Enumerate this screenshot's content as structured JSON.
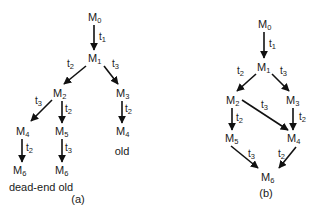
{
  "diagram_a": {
    "caption": "(a)",
    "nodes": [
      {
        "id": "a0",
        "base": "M",
        "sub": "0",
        "x": 93,
        "y": 20
      },
      {
        "id": "a1",
        "base": "M",
        "sub": "1",
        "x": 94,
        "y": 61
      },
      {
        "id": "a2",
        "base": "M",
        "sub": "2",
        "x": 59,
        "y": 96
      },
      {
        "id": "a3",
        "base": "M",
        "sub": "3",
        "x": 122,
        "y": 96
      },
      {
        "id": "a4",
        "base": "M",
        "sub": "4",
        "x": 22,
        "y": 134
      },
      {
        "id": "a5",
        "base": "M",
        "sub": "5",
        "x": 61,
        "y": 134
      },
      {
        "id": "a6",
        "base": "M",
        "sub": "4",
        "x": 122,
        "y": 134
      },
      {
        "id": "a7",
        "base": "M",
        "sub": "6",
        "x": 19,
        "y": 173
      },
      {
        "id": "a8",
        "base": "M",
        "sub": "6",
        "x": 61,
        "y": 173
      }
    ],
    "edges": [
      {
        "from": "a0",
        "to": "a1",
        "label": "t",
        "label_sub": "1"
      },
      {
        "from": "a1",
        "to": "a2",
        "label": "t",
        "label_sub": "2"
      },
      {
        "from": "a1",
        "to": "a3",
        "label": "t",
        "label_sub": "3"
      },
      {
        "from": "a2",
        "to": "a4",
        "label": "t",
        "label_sub": "3"
      },
      {
        "from": "a2",
        "to": "a5",
        "label": "t",
        "label_sub": "2"
      },
      {
        "from": "a3",
        "to": "a6",
        "label": "t",
        "label_sub": "2"
      },
      {
        "from": "a4",
        "to": "a7",
        "label": "t",
        "label_sub": "2"
      },
      {
        "from": "a5",
        "to": "a8",
        "label": "t",
        "label_sub": "3"
      }
    ],
    "annotations": [
      {
        "text": "old",
        "x": 122,
        "y": 154
      },
      {
        "text": "dead-end old",
        "x": 41,
        "y": 190
      }
    ]
  },
  "diagram_b": {
    "caption": "(b)",
    "nodes": [
      {
        "id": "b0",
        "base": "M",
        "sub": "0",
        "x": 264,
        "y": 27
      },
      {
        "id": "b1",
        "base": "M",
        "sub": "1",
        "x": 263,
        "y": 70
      },
      {
        "id": "b2",
        "base": "M",
        "sub": "2",
        "x": 233,
        "y": 103
      },
      {
        "id": "b3",
        "base": "M",
        "sub": "3",
        "x": 292,
        "y": 103
      },
      {
        "id": "b5",
        "base": "M",
        "sub": "5",
        "x": 231,
        "y": 141
      },
      {
        "id": "b4",
        "base": "M",
        "sub": "4",
        "x": 293,
        "y": 141
      },
      {
        "id": "b6",
        "base": "M",
        "sub": "6",
        "x": 267,
        "y": 180
      }
    ],
    "edges": [
      {
        "from": "b0",
        "to": "b1",
        "label": "t",
        "label_sub": "1"
      },
      {
        "from": "b1",
        "to": "b2",
        "label": "t",
        "label_sub": "2"
      },
      {
        "from": "b1",
        "to": "b3",
        "label": "t",
        "label_sub": "3"
      },
      {
        "from": "b2",
        "to": "b5",
        "label": "t",
        "label_sub": "2"
      },
      {
        "from": "b2",
        "to": "b4",
        "label": "t",
        "label_sub": "3"
      },
      {
        "from": "b3",
        "to": "b4",
        "label": "t",
        "label_sub": "2"
      },
      {
        "from": "b5",
        "to": "b6",
        "label": "t",
        "label_sub": "3"
      },
      {
        "from": "b4",
        "to": "b6",
        "label": "t",
        "label_sub": "2"
      }
    ]
  }
}
